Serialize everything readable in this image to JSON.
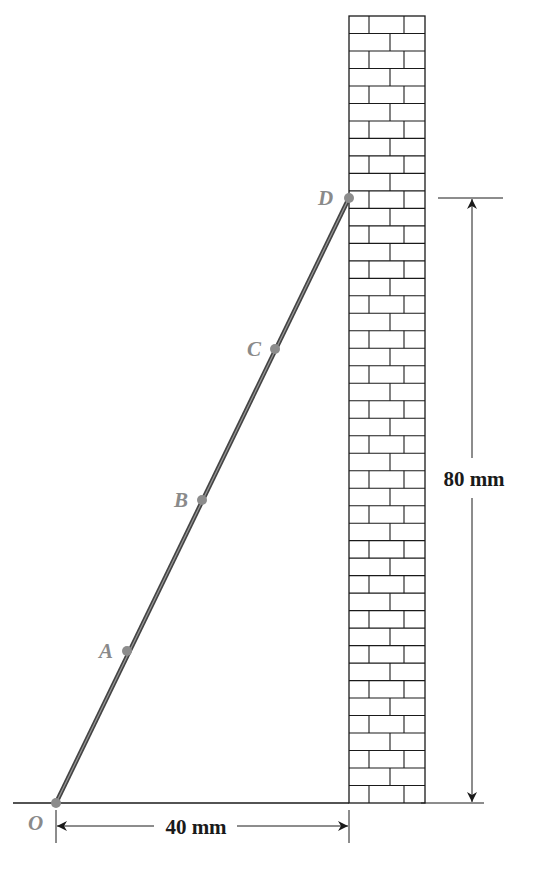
{
  "figure": {
    "points": [
      {
        "name": "O",
        "x": 56,
        "y": 803,
        "lx": 28,
        "ly": 830
      },
      {
        "name": "A",
        "x": 127,
        "y": 651,
        "lx": 99,
        "ly": 658
      },
      {
        "name": "B",
        "x": 202,
        "y": 500,
        "lx": 174,
        "ly": 507
      },
      {
        "name": "C",
        "x": 275,
        "y": 349,
        "lx": 247,
        "ly": 356
      },
      {
        "name": "D",
        "x": 349,
        "y": 198,
        "lx": 318,
        "ly": 205
      }
    ],
    "dimensions": {
      "horizontal": "40 mm",
      "vertical": "80 mm"
    },
    "wall": {
      "x": 349,
      "width": 76,
      "top": 16,
      "bottom": 803,
      "rows": 45
    },
    "colors": {
      "line": "#1a1a1a",
      "rod": "#555555",
      "point": "#8c8c8c",
      "label": "#8a8a8a"
    }
  }
}
